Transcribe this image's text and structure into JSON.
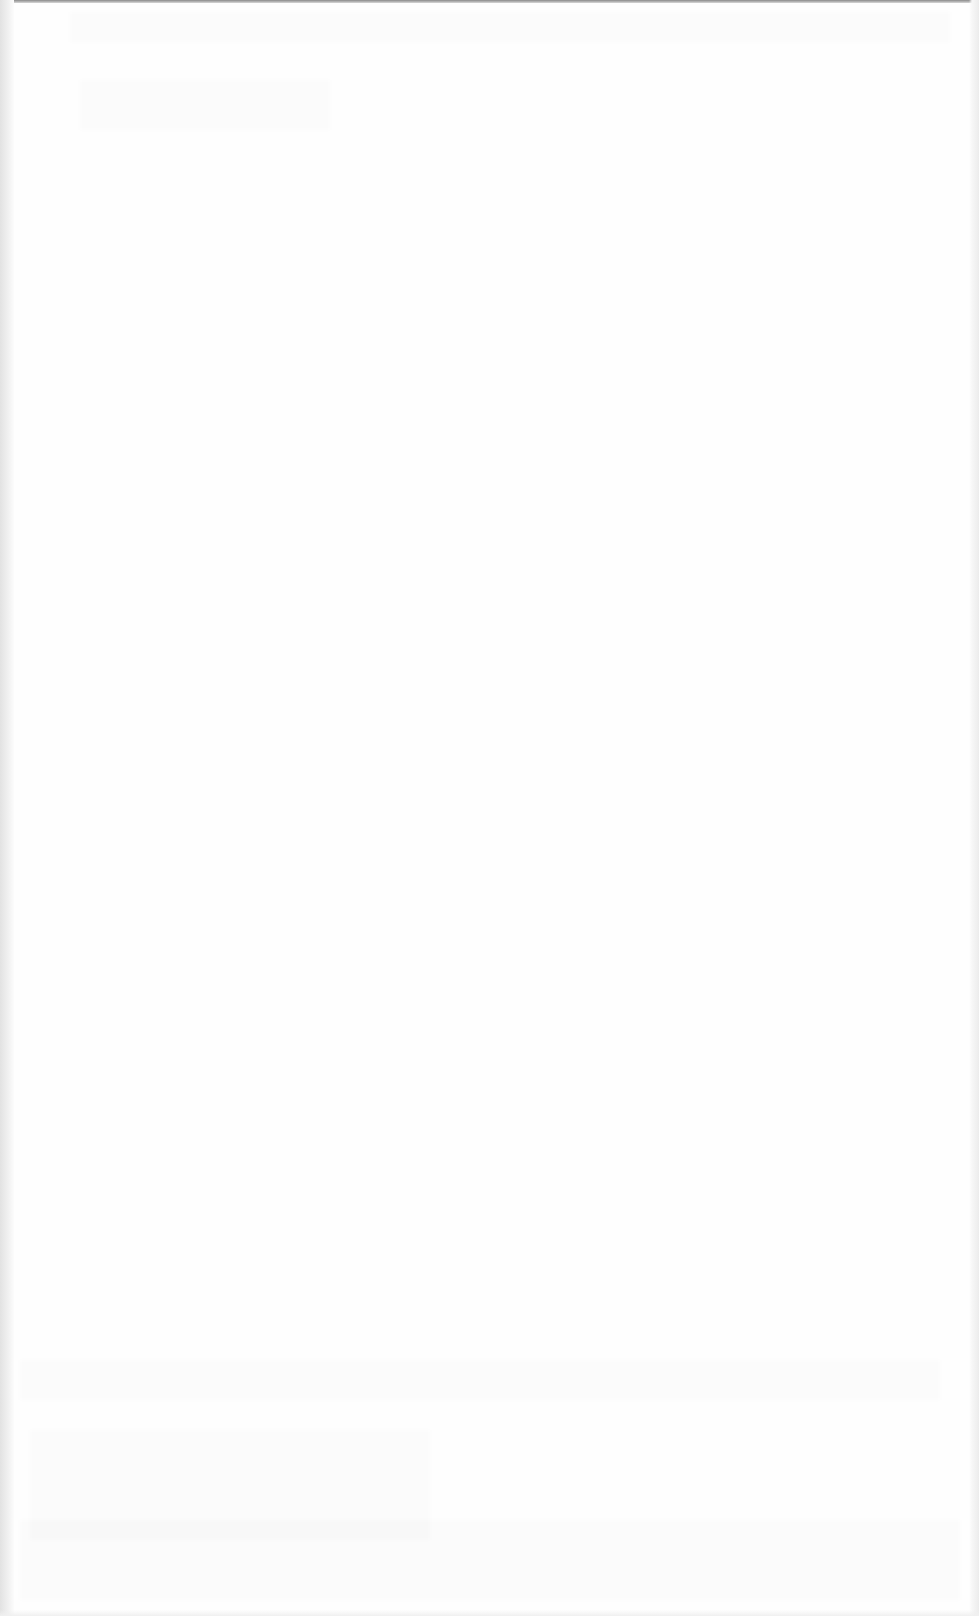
{
  "document": {
    "type": "scanned-page",
    "content": "",
    "legible_text": []
  }
}
